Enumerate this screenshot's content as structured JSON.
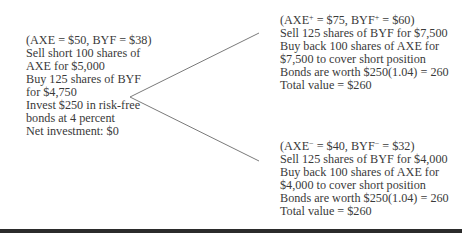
{
  "initial": {
    "prices": "(AXE = $50, BYF = $38)",
    "lines": [
      "Sell short 100 shares of",
      "AXE for $5,000",
      "Buy 125 shares of BYF",
      "for $4,750",
      "Invest $250 in risk-free",
      "bonds at 4 percent",
      "Net investment: $0"
    ]
  },
  "up_state": {
    "prices_prefix": "(AXE",
    "axe_sup": "+",
    "prices_mid": " = $75, BYF",
    "byf_sup": "+",
    "prices_suffix": " = $60)",
    "lines": [
      "Sell 125 shares of BYF for $7,500",
      "Buy back 100 shares of AXE for",
      "$7,500 to cover short position",
      "Bonds are worth $250(1.04) = 260",
      "Total value = $260"
    ]
  },
  "down_state": {
    "prices_prefix": "(AXE",
    "axe_sup": "−",
    "prices_mid": "  = $40, BYF",
    "byf_sup": "−",
    "prices_suffix": "  = $32)",
    "lines": [
      "Sell 125 shares of BYF for $4,000",
      "Buy back 100 shares of AXE for",
      "$4,000 to cover short position",
      "Bonds are worth $250(1.04) = 260",
      "Total value = $260"
    ]
  },
  "colors": {
    "text": "#3a3a3a",
    "branch_line": "#7a7a7a",
    "rule": "#2b2b2b"
  }
}
